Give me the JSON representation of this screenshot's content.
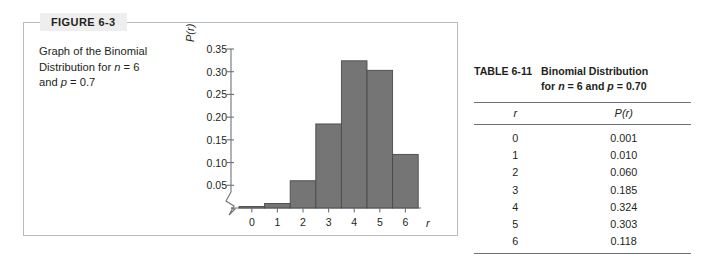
{
  "figure": {
    "tab_label": "FIGURE 6-3",
    "caption_line1": "Graph of the Binomial",
    "caption_line2_a": "Distribution for ",
    "caption_line2_n": "n",
    "caption_line2_b": " = 6",
    "caption_line3_a": "and ",
    "caption_line3_p": "p",
    "caption_line3_b": " = 0.7"
  },
  "table": {
    "caption_id": "TABLE  6-11",
    "caption_title_line1": "Binomial Distribution",
    "caption_title_line2_a": "for ",
    "caption_title_line2_n": "n",
    "caption_title_line2_b": " = 6 and ",
    "caption_title_line2_p": "p",
    "caption_title_line2_c": " = 0.70",
    "headers": [
      "r",
      "P(r)"
    ],
    "rows": [
      {
        "r": "0",
        "p": "0.001"
      },
      {
        "r": "1",
        "p": "0.010"
      },
      {
        "r": "2",
        "p": "0.060"
      },
      {
        "r": "3",
        "p": "0.185"
      },
      {
        "r": "4",
        "p": "0.324"
      },
      {
        "r": "5",
        "p": "0.303"
      },
      {
        "r": "6",
        "p": "0.118"
      }
    ]
  },
  "chart_data": {
    "type": "bar",
    "title": "Graph of the Binomial Distribution for n = 6 and p = 0.7",
    "xlabel": "r",
    "ylabel": "P(r)",
    "categories": [
      "0",
      "1",
      "2",
      "3",
      "4",
      "5",
      "6"
    ],
    "values": [
      0.001,
      0.01,
      0.06,
      0.185,
      0.324,
      0.303,
      0.118
    ],
    "ytick_labels": [
      "0.35",
      "0.30",
      "0.25",
      "0.20",
      "0.15",
      "0.10",
      "0.05"
    ],
    "ytick_values": [
      0.35,
      0.3,
      0.25,
      0.2,
      0.15,
      0.1,
      0.05
    ],
    "ylim": [
      0,
      0.35
    ],
    "axis_break": true,
    "grid": false,
    "legend": false,
    "bar_color": "#757575",
    "bar_edge_color": "#4a4a4a",
    "axis_color": "#6f7376"
  },
  "colors": {
    "figure_border": "#b9bcbe",
    "tab_background": "#eeeeee",
    "rule": "#6f7376",
    "text": "#231f20"
  }
}
